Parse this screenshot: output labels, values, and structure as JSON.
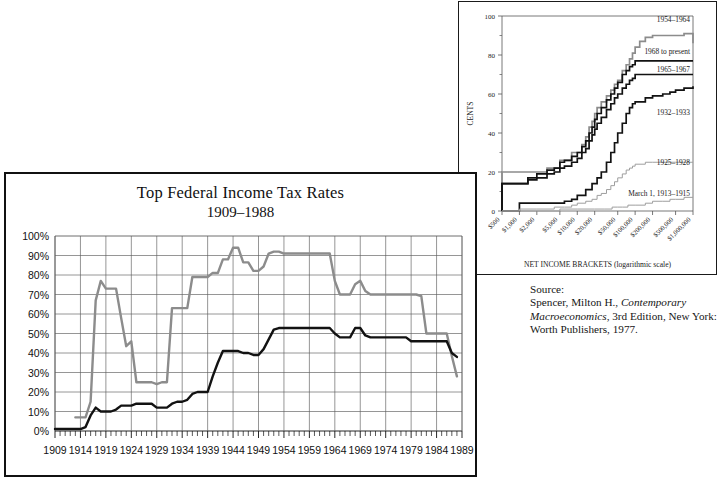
{
  "figure": {
    "source_note": {
      "heading": "Source:",
      "line1_pre": "Spencer, Milton H., ",
      "line1_italic": "Contemporary",
      "line2_italic": "Macroeconomics",
      "line2_post": ", 3rd Edition, New",
      "line3": "York: Worth Publishers, 1977."
    }
  },
  "chart_data": [
    {
      "id": "main-chart",
      "type": "line",
      "title": "Top Federal Income Tax Rates",
      "subtitle": "1909–1988",
      "xlabel": "",
      "ylabel": "",
      "xlim": [
        1909,
        1989
      ],
      "ylim": [
        0,
        100
      ],
      "grid": true,
      "legend": "none",
      "ytick_labels": [
        "0%",
        "10%",
        "20%",
        "30%",
        "40%",
        "50%",
        "60%",
        "70%",
        "80%",
        "90%",
        "100%"
      ],
      "ytick_values": [
        0,
        10,
        20,
        30,
        40,
        50,
        60,
        70,
        80,
        90,
        100
      ],
      "xtick_labels": [
        "1909",
        "1914",
        "1919",
        "1924",
        "1929",
        "1934",
        "1939",
        "1944",
        "1949",
        "1954",
        "1959",
        "1964",
        "1969",
        "1974",
        "1979",
        "1984",
        "1989"
      ],
      "xtick_values": [
        1909,
        1914,
        1919,
        1924,
        1929,
        1934,
        1939,
        1944,
        1949,
        1954,
        1959,
        1964,
        1969,
        1974,
        1979,
        1984,
        1989
      ],
      "minor_xtick_step": 1,
      "series": [
        {
          "name": "Top marginal rate",
          "color": "#8c8c8c",
          "x": [
            1913,
            1915,
            1916,
            1917,
            1918,
            1919,
            1920,
            1921,
            1922,
            1923,
            1924,
            1925,
            1926,
            1927,
            1928,
            1929,
            1930,
            1931,
            1932,
            1933,
            1934,
            1935,
            1936,
            1937,
            1938,
            1939,
            1940,
            1941,
            1942,
            1943,
            1944,
            1945,
            1946,
            1947,
            1948,
            1949,
            1950,
            1951,
            1952,
            1953,
            1954,
            1955,
            1956,
            1957,
            1958,
            1959,
            1960,
            1961,
            1962,
            1963,
            1964,
            1965,
            1966,
            1967,
            1968,
            1969,
            1970,
            1971,
            1972,
            1973,
            1974,
            1975,
            1976,
            1977,
            1978,
            1979,
            1980,
            1981,
            1982,
            1983,
            1984,
            1985,
            1986,
            1987,
            1988
          ],
          "y": [
            7,
            7,
            15,
            67,
            77,
            73,
            73,
            73,
            58,
            43.5,
            46,
            25,
            25,
            25,
            25,
            24,
            25,
            25,
            63,
            63,
            63,
            63,
            79,
            79,
            79,
            79,
            81.1,
            81,
            88,
            88,
            94,
            94,
            86.45,
            86.45,
            82.13,
            82.13,
            84.36,
            91,
            92,
            92,
            91,
            91,
            91,
            91,
            91,
            91,
            91,
            91,
            91,
            91,
            77,
            70,
            70,
            70,
            75.25,
            77,
            71.75,
            70,
            70,
            70,
            70,
            70,
            70,
            70,
            70,
            70,
            70,
            69.125,
            50,
            50,
            50,
            50,
            50,
            38.5,
            28
          ]
        },
        {
          "name": "Effective/alternate rate",
          "color": "#121212",
          "x": [
            1909,
            1910,
            1911,
            1912,
            1913,
            1914,
            1915,
            1916,
            1917,
            1918,
            1919,
            1920,
            1921,
            1922,
            1923,
            1924,
            1925,
            1926,
            1927,
            1928,
            1929,
            1930,
            1931,
            1932,
            1933,
            1934,
            1935,
            1936,
            1937,
            1938,
            1939,
            1940,
            1941,
            1942,
            1943,
            1944,
            1945,
            1946,
            1947,
            1948,
            1949,
            1950,
            1951,
            1952,
            1953,
            1954,
            1955,
            1956,
            1957,
            1958,
            1959,
            1960,
            1961,
            1962,
            1963,
            1964,
            1965,
            1966,
            1967,
            1968,
            1969,
            1970,
            1971,
            1972,
            1973,
            1974,
            1975,
            1976,
            1977,
            1978,
            1979,
            1980,
            1981,
            1982,
            1983,
            1984,
            1985,
            1986,
            1987,
            1988
          ],
          "y": [
            1,
            1,
            1,
            1,
            1,
            1,
            2,
            8,
            12,
            10,
            10,
            10,
            11,
            13,
            13,
            13,
            14,
            14,
            14,
            14,
            12,
            12,
            12,
            14,
            15,
            15,
            16,
            19,
            20,
            20,
            20,
            28,
            35,
            41,
            41,
            41,
            41,
            40,
            40,
            39,
            39,
            42,
            47,
            52,
            52.8,
            52.8,
            52.8,
            52.8,
            52.8,
            52.8,
            52.8,
            52.8,
            52.8,
            52.8,
            52.8,
            50,
            48,
            48,
            48,
            52.8,
            52.8,
            49,
            48,
            48,
            48,
            48,
            48,
            48,
            48,
            48,
            46,
            46,
            46,
            46,
            46,
            46,
            46,
            46,
            40,
            38
          ]
        }
      ]
    },
    {
      "id": "inset-chart",
      "type": "line",
      "title": "",
      "xlabel": "NET INCOME BRACKETS (logarithmic scale)",
      "ylabel": "CENTS",
      "ylim": [
        0,
        100
      ],
      "grid": false,
      "legend": "inline-annotations",
      "ytick_labels": [
        "0",
        "20",
        "40",
        "60",
        "80",
        "100"
      ],
      "ytick_values": [
        0,
        20,
        40,
        60,
        80,
        100
      ],
      "xtick_labels": [
        "$500",
        "$1,000",
        "$2,000",
        "$5,000",
        "$10,000",
        "$20,000",
        "$50,000",
        "$100,000",
        "$200,000",
        "$500,000",
        "$1,000,000"
      ],
      "xtick_values": [
        500,
        1000,
        2000,
        5000,
        10000,
        20000,
        50000,
        100000,
        200000,
        500000,
        1000000
      ],
      "annotations": [
        {
          "label": "1954–1964",
          "color": "#8c8c8c"
        },
        {
          "label": "1968 to present",
          "color": "#121212"
        },
        {
          "label": "1965–1967",
          "color": "#121212"
        },
        {
          "label": "1932–1933",
          "color": "#121212"
        },
        {
          "label": "1925–1928",
          "color": "#9e9e9e"
        },
        {
          "label": "March 1, 1913–1915",
          "color": "#9e9e9e"
        }
      ],
      "series": [
        {
          "name": "1954–1964",
          "color": "#8c8c8c",
          "x": [
            500,
            700,
            1000,
            1400,
            2000,
            3000,
            4000,
            5000,
            6000,
            8000,
            10000,
            12000,
            14000,
            16000,
            18000,
            20000,
            22000,
            26000,
            32000,
            38000,
            44000,
            50000,
            60000,
            70000,
            80000,
            90000,
            100000,
            120000,
            150000,
            200000,
            300000,
            400000,
            500000,
            700000,
            1000000
          ],
          "y": [
            20,
            20,
            20,
            20,
            20,
            22,
            22,
            26,
            26,
            30,
            30,
            34,
            38,
            43,
            46,
            50,
            53,
            56,
            59,
            62,
            65,
            67,
            72,
            75,
            78,
            81,
            84,
            87,
            89,
            90,
            90,
            90,
            90,
            91,
            86
          ]
        },
        {
          "name": "1968 to present",
          "color": "#121212",
          "x": [
            500,
            700,
            1000,
            1400,
            2000,
            3000,
            4000,
            5000,
            6000,
            8000,
            10000,
            12000,
            14000,
            16000,
            18000,
            20000,
            22000,
            26000,
            32000,
            38000,
            44000,
            50000,
            60000,
            70000,
            80000,
            90000,
            100000,
            150000,
            200000,
            500000,
            1000000
          ],
          "y": [
            14,
            14,
            14,
            17,
            19,
            21,
            22,
            25,
            26,
            28,
            30,
            33,
            36,
            40,
            43,
            47,
            50,
            53,
            57,
            60,
            63,
            66,
            70,
            72,
            74,
            75,
            77,
            77,
            77,
            77,
            77
          ]
        },
        {
          "name": "1965–1967",
          "color": "#121212",
          "x": [
            500,
            700,
            1000,
            1400,
            2000,
            3000,
            4000,
            5000,
            6000,
            8000,
            10000,
            12000,
            14000,
            16000,
            18000,
            20000,
            22000,
            26000,
            32000,
            38000,
            44000,
            50000,
            60000,
            70000,
            80000,
            90000,
            100000,
            150000,
            200000,
            500000,
            1000000
          ],
          "y": [
            14,
            14,
            14,
            16,
            17,
            19,
            20,
            22,
            23,
            25,
            27,
            30,
            32,
            36,
            39,
            42,
            45,
            48,
            52,
            55,
            58,
            60,
            63,
            65,
            67,
            68,
            70,
            70,
            70,
            70,
            70
          ]
        },
        {
          "name": "1932–1933",
          "color": "#121212",
          "x": [
            500,
            1000,
            2000,
            4000,
            6000,
            8000,
            10000,
            14000,
            18000,
            22000,
            26000,
            32000,
            38000,
            44000,
            50000,
            60000,
            70000,
            80000,
            90000,
            100000,
            150000,
            200000,
            300000,
            400000,
            500000,
            700000,
            1000000
          ],
          "y": [
            0,
            4,
            4,
            4,
            5,
            6,
            8,
            11,
            14,
            17,
            20,
            25,
            30,
            35,
            40,
            45,
            50,
            53,
            55,
            56,
            58,
            59,
            60,
            61,
            62,
            63,
            64
          ]
        },
        {
          "name": "1925–1928",
          "color": "#9e9e9e",
          "x": [
            500,
            1000,
            2000,
            4000,
            6000,
            8000,
            10000,
            14000,
            18000,
            22000,
            26000,
            32000,
            38000,
            44000,
            50000,
            60000,
            70000,
            80000,
            90000,
            100000,
            150000,
            200000,
            500000,
            1000000
          ],
          "y": [
            0,
            1,
            1,
            2,
            2,
            3,
            4,
            5,
            6,
            8,
            9,
            11,
            13,
            15,
            17,
            19,
            21,
            22,
            23,
            24,
            25,
            25,
            25,
            25
          ]
        },
        {
          "name": "March 1, 1913–1915",
          "color": "#9e9e9e",
          "x": [
            500,
            1000,
            2000,
            5000,
            10000,
            20000,
            30000,
            40000,
            50000,
            60000,
            75000,
            100000,
            150000,
            200000,
            300000,
            400000,
            500000,
            700000,
            1000000
          ],
          "y": [
            0,
            0,
            0,
            1,
            1,
            1,
            1,
            2,
            2,
            2,
            3,
            3,
            4,
            5,
            5,
            6,
            6,
            7,
            7
          ]
        }
      ]
    }
  ]
}
